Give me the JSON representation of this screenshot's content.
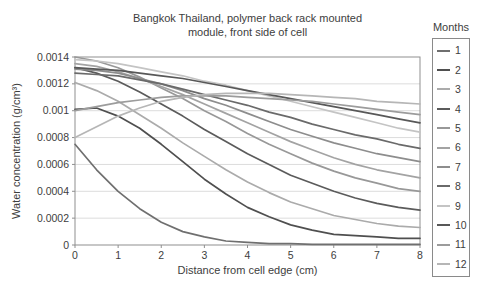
{
  "chart_data": {
    "type": "line",
    "title": "Bangkok Thailand, polymer back rack mounted module, front side of cell",
    "title_lines": [
      "Bangkok Thailand, polymer back rack mounted",
      "module, front side of cell"
    ],
    "xlabel": "Distance from cell edge (cm)",
    "ylabel": "Water concentration (g/cm³)",
    "xlim": [
      0,
      8
    ],
    "ylim": [
      0,
      0.0014
    ],
    "xticks": [
      0,
      1,
      2,
      3,
      4,
      5,
      6,
      7,
      8
    ],
    "yticks": [
      0,
      0.0002,
      0.0004,
      0.0006,
      0.0008,
      0.001,
      0.0012,
      0.0014
    ],
    "ytick_labels": [
      "0",
      "0.0002",
      "0.0004",
      "0.0006",
      "0.0008",
      "0.001",
      "0.0012",
      "0.0014"
    ],
    "grid": "horizontal-only",
    "legend_title": "Months",
    "legend_position": "right",
    "frame_color": "#8f8f8f",
    "gridline_color": "#dcdcdc",
    "x": [
      0,
      0.5,
      1,
      1.5,
      2,
      2.5,
      3,
      3.5,
      4,
      4.5,
      5,
      5.5,
      6,
      6.5,
      7,
      7.5,
      8
    ],
    "series": [
      {
        "name": "1",
        "color": "#6f6f6f",
        "values": [
          0.00075,
          0.00056,
          0.0004,
          0.00027,
          0.00017,
          0.0001,
          6e-05,
          3e-05,
          2e-05,
          1e-05,
          1e-05,
          5e-06,
          5e-06,
          5e-06,
          5e-06,
          5e-06,
          5e-06
        ]
      },
      {
        "name": "2",
        "color": "#4f4f4f",
        "values": [
          0.00101,
          0.00102,
          0.00096,
          0.00087,
          0.00075,
          0.00062,
          0.00049,
          0.00038,
          0.00028,
          0.00021,
          0.00015,
          0.00011,
          8e-05,
          7e-05,
          6e-05,
          5e-05,
          5e-05
        ]
      },
      {
        "name": "3",
        "color": "#ababab",
        "values": [
          0.00121,
          0.00115,
          0.00107,
          0.00097,
          0.00087,
          0.00076,
          0.00066,
          0.00056,
          0.00047,
          0.00039,
          0.00032,
          0.00027,
          0.00022,
          0.00019,
          0.00016,
          0.00014,
          0.00013
        ]
      },
      {
        "name": "4",
        "color": "#5b5b5b",
        "values": [
          0.00132,
          0.00128,
          0.00122,
          0.00114,
          0.00105,
          0.00096,
          0.00086,
          0.00077,
          0.00068,
          0.0006,
          0.00052,
          0.00046,
          0.0004,
          0.00035,
          0.00031,
          0.00028,
          0.00026
        ]
      },
      {
        "name": "5",
        "color": "#989898",
        "values": [
          0.0014,
          0.00137,
          0.00132,
          0.00125,
          0.00117,
          0.00109,
          0.001,
          0.00092,
          0.00083,
          0.00075,
          0.00068,
          0.00061,
          0.00055,
          0.0005,
          0.00046,
          0.00042,
          0.0004
        ]
      },
      {
        "name": "6",
        "color": "#a3a3a3",
        "values": [
          0.00135,
          0.00133,
          0.00129,
          0.00124,
          0.00118,
          0.00112,
          0.00105,
          0.00098,
          0.00091,
          0.00084,
          0.00077,
          0.00071,
          0.00065,
          0.0006,
          0.00056,
          0.00053,
          0.0005
        ]
      },
      {
        "name": "7",
        "color": "#8d8d8d",
        "values": [
          0.00131,
          0.0013,
          0.00128,
          0.00124,
          0.0012,
          0.00115,
          0.00109,
          0.00104,
          0.00098,
          0.00092,
          0.00086,
          0.00081,
          0.00076,
          0.00072,
          0.00068,
          0.00065,
          0.00062
        ]
      },
      {
        "name": "8",
        "color": "#6a6a6a",
        "values": [
          0.00128,
          0.00127,
          0.00126,
          0.00123,
          0.0012,
          0.00116,
          0.00112,
          0.00108,
          0.00104,
          0.00099,
          0.00095,
          0.0009,
          0.00086,
          0.00082,
          0.00079,
          0.00075,
          0.00072
        ]
      },
      {
        "name": "9",
        "color": "#c4c4c4",
        "values": [
          0.00138,
          0.00137,
          0.00135,
          0.00132,
          0.00129,
          0.00126,
          0.00122,
          0.00119,
          0.00115,
          0.00111,
          0.00107,
          0.00103,
          0.00099,
          0.00095,
          0.00091,
          0.00087,
          0.00084
        ]
      },
      {
        "name": "10",
        "color": "#585858",
        "values": [
          0.00132,
          0.00131,
          0.0013,
          0.00128,
          0.00126,
          0.00124,
          0.00121,
          0.00118,
          0.00115,
          0.00112,
          0.00109,
          0.00106,
          0.00103,
          0.001,
          0.00097,
          0.00094,
          0.00091
        ]
      },
      {
        "name": "11",
        "color": "#9c9c9c",
        "values": [
          0.001,
          0.00103,
          0.00106,
          0.00108,
          0.0011,
          0.00111,
          0.00111,
          0.00111,
          0.0011,
          0.00109,
          0.00108,
          0.00107,
          0.00105,
          0.00103,
          0.00101,
          0.00099,
          0.00097
        ]
      },
      {
        "name": "12",
        "color": "#b6b6b6",
        "values": [
          0.0008,
          0.00088,
          0.00096,
          0.00102,
          0.00107,
          0.0011,
          0.00112,
          0.00113,
          0.00113,
          0.00113,
          0.00112,
          0.00111,
          0.0011,
          0.00109,
          0.00107,
          0.00106,
          0.00105
        ]
      }
    ]
  }
}
